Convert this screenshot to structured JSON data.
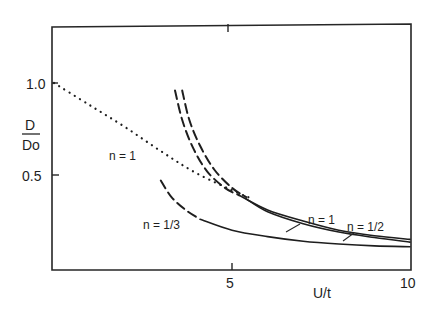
{
  "chart_data": {
    "type": "line",
    "title": "",
    "xlabel": "U/t",
    "ylabel_num": "D",
    "ylabel_den": "Do",
    "xlim": [
      0,
      10
    ],
    "ylim": [
      0,
      1.32
    ],
    "grid": false,
    "legend": "none (inline curve labels)",
    "x_ticks": [
      {
        "value": 5,
        "label": "5"
      },
      {
        "value": 10,
        "label": "10"
      }
    ],
    "y_ticks": [
      {
        "value": 1.0,
        "label": "1.0"
      },
      {
        "value": 0.5,
        "label": "0.5"
      }
    ],
    "series": [
      {
        "name": "n=1 (dotted, small U/t)",
        "style": "dotted",
        "label": "n = 1",
        "points": [
          [
            0,
            1.0
          ],
          [
            1,
            0.88
          ],
          [
            2,
            0.76
          ],
          [
            3,
            0.63
          ],
          [
            4,
            0.51
          ],
          [
            5.2,
            0.4
          ],
          [
            5.6,
            0.37
          ]
        ]
      },
      {
        "name": "n=1 (dashed, large-U/t asymptote)",
        "style": "dashed",
        "points": [
          [
            3.4,
            0.96
          ],
          [
            3.6,
            0.8
          ],
          [
            3.9,
            0.65
          ],
          [
            4.3,
            0.52
          ],
          [
            4.8,
            0.43
          ],
          [
            5.2,
            0.39
          ]
        ]
      },
      {
        "name": "n=1/2 (dashed, large-U/t asymptote)",
        "style": "dashed",
        "points": [
          [
            3.6,
            0.96
          ],
          [
            3.8,
            0.8
          ],
          [
            4.1,
            0.66
          ],
          [
            4.5,
            0.53
          ],
          [
            5.0,
            0.43
          ],
          [
            5.4,
            0.38
          ]
        ]
      },
      {
        "name": "n=1 (solid)",
        "style": "solid",
        "label": "n = 1",
        "points": [
          [
            5.2,
            0.39
          ],
          [
            6,
            0.31
          ],
          [
            7,
            0.25
          ],
          [
            8,
            0.2
          ],
          [
            9,
            0.17
          ],
          [
            10,
            0.15
          ]
        ]
      },
      {
        "name": "n=1/2 (solid)",
        "style": "solid",
        "label": "n = 1/2",
        "points": [
          [
            5.4,
            0.37
          ],
          [
            6,
            0.3
          ],
          [
            7,
            0.235
          ],
          [
            8,
            0.19
          ],
          [
            9,
            0.16
          ],
          [
            10,
            0.135
          ]
        ]
      },
      {
        "name": "n=1/3 (dashed)",
        "style": "dashed",
        "points": [
          [
            3.0,
            0.47
          ],
          [
            3.3,
            0.38
          ],
          [
            3.7,
            0.31
          ],
          [
            4.1,
            0.26
          ]
        ]
      },
      {
        "name": "n=1/3 (solid)",
        "style": "solid",
        "label": "n = 1/3",
        "points": [
          [
            4.1,
            0.26
          ],
          [
            5,
            0.2
          ],
          [
            6,
            0.165
          ],
          [
            7,
            0.14
          ],
          [
            8,
            0.125
          ],
          [
            9,
            0.115
          ],
          [
            10,
            0.11
          ]
        ]
      }
    ],
    "annotations": [
      {
        "text": "n = 1",
        "near": [
          2.5,
          0.55
        ]
      },
      {
        "text": "n = 1/3",
        "near": [
          3.2,
          0.2
        ]
      },
      {
        "text": "n = 1",
        "near": [
          7.6,
          0.34
        ]
      },
      {
        "text": "n = 1/2",
        "near": [
          9.2,
          0.3
        ]
      }
    ]
  }
}
